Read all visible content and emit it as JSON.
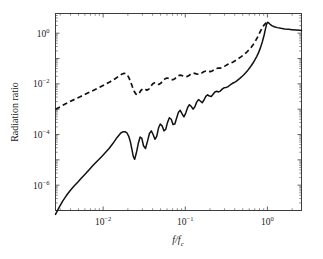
{
  "figure": {
    "background_color": "#ffffff",
    "line_color": "#111111",
    "axis_color": "#3d3d3d"
  },
  "axes": {
    "x_title_main": "f/f",
    "x_title_sub": "c",
    "y_title": "Radiation ratio",
    "x_tick_labels": [
      "10",
      "10",
      "10"
    ],
    "x_tick_exponents": [
      "−2",
      "−1",
      "0"
    ],
    "y_tick_labels": [
      "10",
      "10",
      "10",
      "10"
    ],
    "y_tick_exponents": [
      "0",
      "−2",
      "−4",
      "−6"
    ]
  },
  "chart_data": {
    "type": "line",
    "title": "",
    "xlabel": "f/f_c",
    "ylabel": "Radiation ratio",
    "xscale": "log",
    "yscale": "log",
    "xlim": [
      0.00263,
      2.6
    ],
    "ylim": [
      1e-07,
      6.0
    ],
    "grid": false,
    "legend_position": "none",
    "x_ticks": [
      0.01,
      0.1,
      1
    ],
    "y_ticks": [
      1,
      0.01,
      0.0001,
      1e-06
    ],
    "series": [
      {
        "name": "solid-curve",
        "style": "solid",
        "color": "#111111",
        "x": [
          0.00263,
          0.0029,
          0.0032,
          0.00355,
          0.00395,
          0.0044,
          0.0049,
          0.00545,
          0.0061,
          0.0068,
          0.0076,
          0.0085,
          0.0095,
          0.0106,
          0.0118,
          0.0132,
          0.0147,
          0.0164,
          0.0176,
          0.0186,
          0.0195,
          0.0205,
          0.0215,
          0.0225,
          0.0233,
          0.0242,
          0.0254,
          0.0268,
          0.0282,
          0.0296,
          0.031,
          0.0328,
          0.0347,
          0.0366,
          0.0386,
          0.0406,
          0.0427,
          0.0449,
          0.0472,
          0.0496,
          0.0522,
          0.0549,
          0.0578,
          0.0608,
          0.064,
          0.0674,
          0.0709,
          0.0746,
          0.0785,
          0.0826,
          0.0869,
          0.0915,
          0.0963,
          0.1013,
          0.1066,
          0.1122,
          0.1181,
          0.1243,
          0.1308,
          0.1377,
          0.1449,
          0.1525,
          0.1605,
          0.1689,
          0.1778,
          0.1871,
          0.1969,
          0.2072,
          0.218,
          0.2294,
          0.2414,
          0.2541,
          0.2674,
          0.2814,
          0.2962,
          0.3117,
          0.328,
          0.3452,
          0.3633,
          0.3824,
          0.4025,
          0.4236,
          0.4458,
          0.4692,
          0.4938,
          0.5197,
          0.5469,
          0.5756,
          0.6058,
          0.6376,
          0.671,
          0.7062,
          0.7433,
          0.7823,
          0.8233,
          0.8665,
          0.912,
          0.95,
          0.98,
          1.005,
          1.03,
          1.07,
          1.13,
          1.21,
          1.32,
          1.46,
          1.62,
          1.8,
          2.0,
          2.22,
          2.45,
          2.6
        ],
        "y": [
          7e-08,
          1.3e-07,
          2.3e-07,
          3.8e-07,
          6e-07,
          9e-07,
          1.3e-06,
          1.9e-06,
          2.8e-06,
          4.2e-06,
          6.2e-06,
          9e-06,
          1.3e-05,
          1.9e-05,
          2.8e-05,
          4.5e-05,
          7.5e-05,
          0.000115,
          0.00013,
          0.000128,
          0.000115,
          8.5e-05,
          5e-05,
          2.4e-05,
          1.35e-05,
          1.05e-05,
          1.9e-05,
          4.5e-05,
          8e-05,
          7e-05,
          3.6e-05,
          2.8e-05,
          5.5e-05,
          0.00011,
          0.00014,
          0.0001,
          6.5e-05,
          8.5e-05,
          0.00018,
          0.00026,
          0.00022,
          0.00014,
          0.00016,
          0.0003,
          0.00046,
          0.0004,
          0.00025,
          0.00026,
          0.00045,
          0.00075,
          0.0009,
          0.00065,
          0.0005,
          0.0007,
          0.00115,
          0.0015,
          0.0013,
          0.001,
          0.00125,
          0.0019,
          0.0024,
          0.0021,
          0.0018,
          0.0023,
          0.0032,
          0.0037,
          0.0033,
          0.0032,
          0.0039,
          0.0048,
          0.0051,
          0.0048,
          0.0052,
          0.0062,
          0.007,
          0.0072,
          0.0076,
          0.0086,
          0.0098,
          0.0108,
          0.0118,
          0.0132,
          0.015,
          0.0172,
          0.02,
          0.0235,
          0.028,
          0.034,
          0.042,
          0.053,
          0.068,
          0.09,
          0.122,
          0.175,
          0.27,
          0.45,
          0.85,
          1.55,
          2.3,
          2.7,
          2.6,
          2.3,
          2.0,
          1.8,
          1.66,
          1.56,
          1.48,
          1.42,
          1.37,
          1.33,
          1.3,
          1.28
        ]
      },
      {
        "name": "dashed-curve",
        "style": "dashed",
        "color": "#111111",
        "x": [
          0.00263,
          0.003,
          0.00345,
          0.00395,
          0.00455,
          0.00525,
          0.00605,
          0.00695,
          0.008,
          0.0092,
          0.0106,
          0.0122,
          0.014,
          0.0156,
          0.017,
          0.018,
          0.0188,
          0.0196,
          0.0205,
          0.0215,
          0.0226,
          0.0238,
          0.025,
          0.0262,
          0.0275,
          0.029,
          0.0306,
          0.0323,
          0.0341,
          0.036,
          0.038,
          0.0402,
          0.0425,
          0.0449,
          0.0475,
          0.0502,
          0.0531,
          0.0562,
          0.0595,
          0.063,
          0.0667,
          0.0706,
          0.0748,
          0.0792,
          0.0839,
          0.0889,
          0.0942,
          0.0998,
          0.1057,
          0.112,
          0.1187,
          0.1258,
          0.1333,
          0.1413,
          0.1497,
          0.1586,
          0.168,
          0.178,
          0.1886,
          0.1998,
          0.2117,
          0.2243,
          0.2377,
          0.2518,
          0.2668,
          0.2827,
          0.2995,
          0.3173,
          0.3362,
          0.3562,
          0.3774,
          0.3999,
          0.4237,
          0.4489,
          0.4757,
          0.504,
          0.534,
          0.5658,
          0.5995,
          0.6352,
          0.673,
          0.713,
          0.7555,
          0.8005,
          0.8482,
          0.8988,
          0.95,
          0.99,
          1.02,
          1.05
        ],
        "y": [
          0.001,
          0.00125,
          0.0016,
          0.002,
          0.0025,
          0.0031,
          0.0039,
          0.0048,
          0.006,
          0.0075,
          0.0095,
          0.0122,
          0.016,
          0.0205,
          0.0245,
          0.026,
          0.0255,
          0.023,
          0.018,
          0.0125,
          0.008,
          0.0052,
          0.004,
          0.0037,
          0.0043,
          0.0056,
          0.0065,
          0.0062,
          0.0056,
          0.0062,
          0.008,
          0.01,
          0.011,
          0.0105,
          0.0095,
          0.0105,
          0.013,
          0.0155,
          0.017,
          0.0165,
          0.015,
          0.0145,
          0.016,
          0.019,
          0.0215,
          0.022,
          0.0205,
          0.019,
          0.0195,
          0.022,
          0.025,
          0.0265,
          0.0255,
          0.024,
          0.0245,
          0.027,
          0.03,
          0.032,
          0.0315,
          0.0305,
          0.032,
          0.036,
          0.04,
          0.042,
          0.042,
          0.044,
          0.049,
          0.055,
          0.061,
          0.066,
          0.072,
          0.08,
          0.09,
          0.102,
          0.116,
          0.134,
          0.156,
          0.185,
          0.225,
          0.28,
          0.36,
          0.48,
          0.68,
          1.0,
          1.45,
          2.0,
          2.45,
          2.7,
          2.72,
          2.62
        ]
      }
    ]
  }
}
